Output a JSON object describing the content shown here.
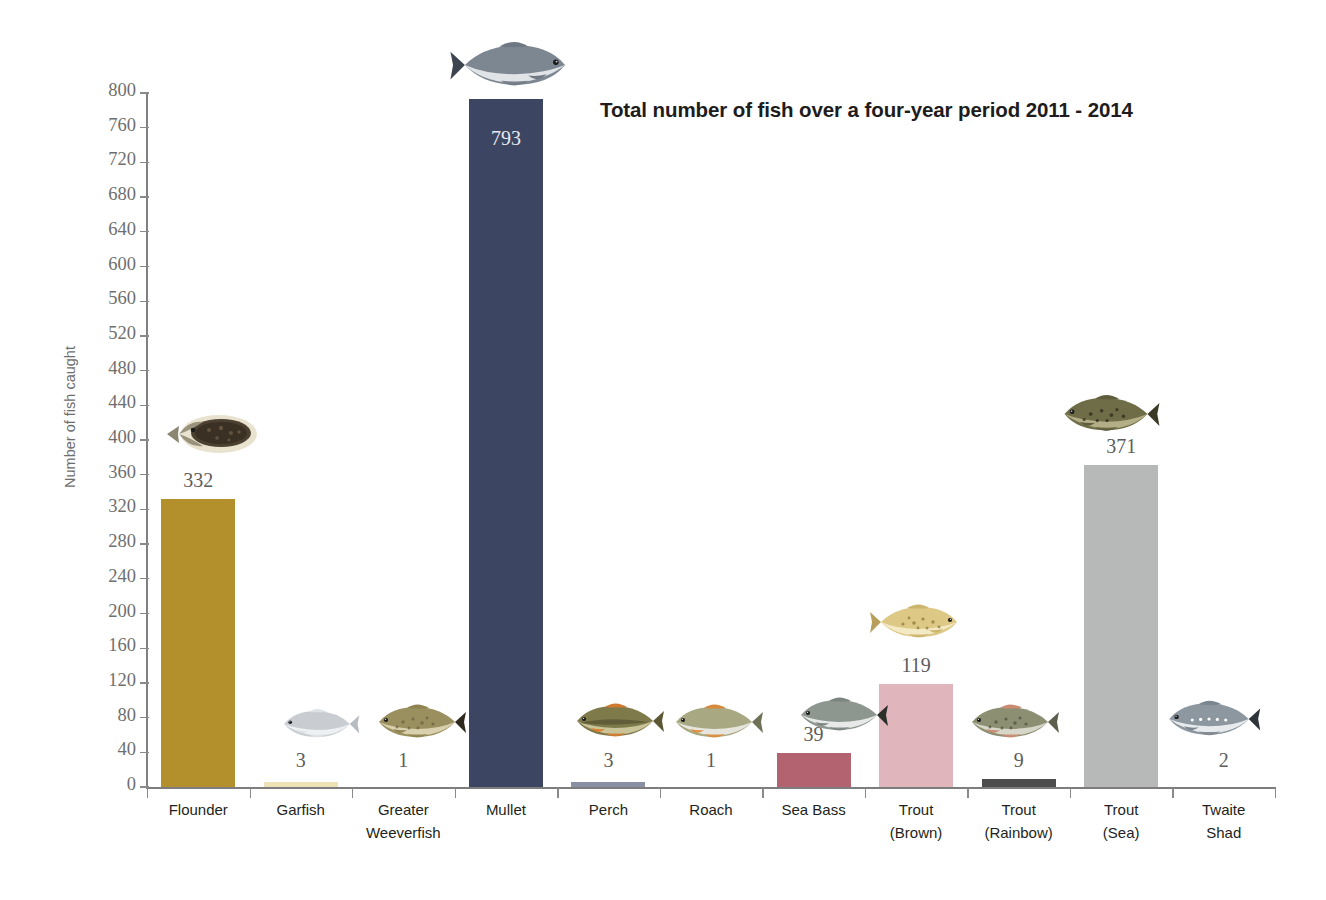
{
  "chart_data": {
    "type": "bar",
    "title": "Total number of fish over a four-year period 2011 - 2014",
    "xlabel": "",
    "ylabel": "Number of fish caught",
    "ylim": [
      0,
      800
    ],
    "ytick_step": 40,
    "grid": false,
    "legend": "none",
    "categories": [
      "Flounder",
      "Garfish",
      "Greater Weeverfish",
      "Mullet",
      "Perch",
      "Roach",
      "Sea Bass",
      "Trout (Brown)",
      "Trout (Rainbow)",
      "Trout (Sea)",
      "Twaite Shad"
    ],
    "category_lines": [
      [
        "Flounder"
      ],
      [
        "Garfish"
      ],
      [
        "Greater",
        "Weeverfish"
      ],
      [
        "Mullet"
      ],
      [
        "Perch"
      ],
      [
        "Roach"
      ],
      [
        "Sea Bass"
      ],
      [
        "Trout",
        "(Brown)"
      ],
      [
        "Trout",
        "(Rainbow)"
      ],
      [
        "Trout",
        "(Sea)"
      ],
      [
        "Twaite",
        "Shad"
      ]
    ],
    "values": [
      332,
      3,
      1,
      793,
      3,
      1,
      39,
      119,
      9,
      371,
      2
    ],
    "value_labels": [
      "332",
      "3",
      "1",
      "793",
      "3",
      "1",
      "39",
      "119",
      "9",
      "371",
      "2"
    ],
    "ytick_labels": [
      "0",
      "40",
      "80",
      "120",
      "160",
      "200",
      "240",
      "280",
      "320",
      "360",
      "400",
      "440",
      "480",
      "520",
      "560",
      "600",
      "640",
      "680",
      "720",
      "760",
      "800"
    ],
    "bar_colors": [
      "#b3902b",
      "#ece2b6",
      "#ffffff",
      "#3c4662",
      "#8a8fa5",
      "#ffffff",
      "#b3636f",
      "#e0b6bc",
      "#4d4d4d",
      "#b7b9b8",
      "#ffffff"
    ],
    "label_inside": [
      false,
      false,
      false,
      true,
      false,
      false,
      false,
      false,
      false,
      false,
      false
    ],
    "fish_icons": [
      "flounder-fish-icon",
      "garfish-fish-icon",
      "greater-weeverfish-fish-icon",
      "mullet-fish-icon",
      "perch-fish-icon",
      "roach-fish-icon",
      "sea-bass-fish-icon",
      "trout-brown-fish-icon",
      "trout-rainbow-fish-icon",
      "trout-sea-fish-icon",
      "twaite-shad-fish-icon"
    ]
  },
  "colors": {
    "axis": "#8a8a8a",
    "tick_label": "#6f6f6f",
    "value_label": "#5d5d5d",
    "value_label_inside": "#e8e9ef",
    "title": "#201c1c",
    "axis_title": "#6d6d6d",
    "category_label": "#231f20",
    "background": "#ffffff"
  }
}
